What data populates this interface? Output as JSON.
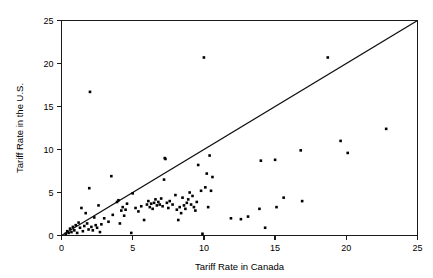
{
  "chart_data": {
    "type": "scatter",
    "title": "",
    "xlabel": "Tariff Rate in Canada",
    "ylabel": "Tariff Rate in the U.S.",
    "xlim": [
      0,
      25
    ],
    "ylim": [
      0,
      25
    ],
    "xticks": [
      0,
      5,
      10,
      15,
      20,
      25
    ],
    "yticks": [
      0,
      5,
      10,
      15,
      20,
      25
    ],
    "xtick_labels": [
      "0",
      "5",
      "10",
      "15",
      "20",
      "25"
    ],
    "ytick_labels": [
      "0",
      "5",
      "10",
      "15",
      "20",
      "25"
    ],
    "grid": false,
    "legend": null,
    "annotations": [],
    "reference_line": {
      "name": "45-degree-line",
      "description": "y = x diagonal reference line",
      "from": [
        0,
        0
      ],
      "to": [
        25,
        25
      ]
    },
    "marker": {
      "shape": "square",
      "color": "#000000",
      "size": 2.6
    },
    "points": [
      [
        0.3,
        0.2
      ],
      [
        0.4,
        0.5
      ],
      [
        0.5,
        0.3
      ],
      [
        0.6,
        0.8
      ],
      [
        0.7,
        0.4
      ],
      [
        0.8,
        1.0
      ],
      [
        0.9,
        0.6
      ],
      [
        1.0,
        1.2
      ],
      [
        1.1,
        0.3
      ],
      [
        1.2,
        1.5
      ],
      [
        1.3,
        0.9
      ],
      [
        1.4,
        3.2
      ],
      [
        1.5,
        0.5
      ],
      [
        1.6,
        1.1
      ],
      [
        1.7,
        2.6
      ],
      [
        1.8,
        1.4
      ],
      [
        1.9,
        0.7
      ],
      [
        1.95,
        5.5
      ],
      [
        2.0,
        16.7
      ],
      [
        2.1,
        1.0
      ],
      [
        2.2,
        0.6
      ],
      [
        2.3,
        2.1
      ],
      [
        2.4,
        1.2
      ],
      [
        2.5,
        0.9
      ],
      [
        2.6,
        3.5
      ],
      [
        2.7,
        0.4
      ],
      [
        2.8,
        1.3
      ],
      [
        3.0,
        2.0
      ],
      [
        3.3,
        1.6
      ],
      [
        3.5,
        6.9
      ],
      [
        3.6,
        2.4
      ],
      [
        3.9,
        3.9
      ],
      [
        4.0,
        4.1
      ],
      [
        4.1,
        1.4
      ],
      [
        4.2,
        2.9
      ],
      [
        4.3,
        3.3
      ],
      [
        4.4,
        2.3
      ],
      [
        4.5,
        3.0
      ],
      [
        4.6,
        3.7
      ],
      [
        4.9,
        0.3
      ],
      [
        5.0,
        4.9
      ],
      [
        5.2,
        3.2
      ],
      [
        5.4,
        2.8
      ],
      [
        5.6,
        3.4
      ],
      [
        5.8,
        1.8
      ],
      [
        6.0,
        3.6
      ],
      [
        6.1,
        4.0
      ],
      [
        6.2,
        3.3
      ],
      [
        6.3,
        3.7
      ],
      [
        6.4,
        3.1
      ],
      [
        6.5,
        3.8
      ],
      [
        6.6,
        4.2
      ],
      [
        6.7,
        3.5
      ],
      [
        6.8,
        3.9
      ],
      [
        6.9,
        3.6
      ],
      [
        7.0,
        4.3
      ],
      [
        7.1,
        3.4
      ],
      [
        7.2,
        6.5
      ],
      [
        7.25,
        9.0
      ],
      [
        7.3,
        8.9
      ],
      [
        7.4,
        3.8
      ],
      [
        7.5,
        3.2
      ],
      [
        7.6,
        4.0
      ],
      [
        7.8,
        3.6
      ],
      [
        8.0,
        4.7
      ],
      [
        8.1,
        3.0
      ],
      [
        8.2,
        1.8
      ],
      [
        8.3,
        3.3
      ],
      [
        8.4,
        2.6
      ],
      [
        8.5,
        4.4
      ],
      [
        8.6,
        3.5
      ],
      [
        8.7,
        3.1
      ],
      [
        8.8,
        3.8
      ],
      [
        8.9,
        4.2
      ],
      [
        9.0,
        5.0
      ],
      [
        9.1,
        3.6
      ],
      [
        9.2,
        4.6
      ],
      [
        9.3,
        3.3
      ],
      [
        9.4,
        2.9
      ],
      [
        9.5,
        3.9
      ],
      [
        9.6,
        8.2
      ],
      [
        9.8,
        5.2
      ],
      [
        9.9,
        0.2
      ],
      [
        10.0,
        20.7
      ],
      [
        10.1,
        5.6
      ],
      [
        10.2,
        7.2
      ],
      [
        10.3,
        3.3
      ],
      [
        10.4,
        9.3
      ],
      [
        10.5,
        5.2
      ],
      [
        10.6,
        6.8
      ],
      [
        11.9,
        2.0
      ],
      [
        12.6,
        1.9
      ],
      [
        13.1,
        2.2
      ],
      [
        13.9,
        3.1
      ],
      [
        14.0,
        8.7
      ],
      [
        14.3,
        0.9
      ],
      [
        15.0,
        8.8
      ],
      [
        15.1,
        3.3
      ],
      [
        15.6,
        4.4
      ],
      [
        16.8,
        9.9
      ],
      [
        16.9,
        4.0
      ],
      [
        18.7,
        20.7
      ],
      [
        19.6,
        11.0
      ],
      [
        20.1,
        9.6
      ],
      [
        22.8,
        12.4
      ]
    ]
  }
}
